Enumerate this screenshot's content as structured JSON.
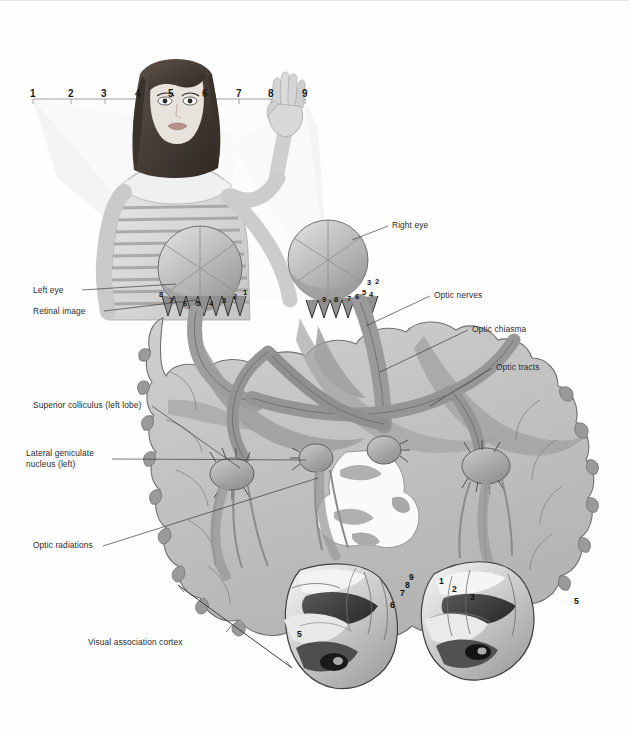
{
  "figure": {
    "background": "#ffffff",
    "palette": {
      "cortex_light": "#c9c9c9",
      "cortex_mid": "#a6a6a6",
      "cortex_dark": "#8c8c8c",
      "tract_gray": "#9a9a9a",
      "outline": "#4a4a4a",
      "cone_fill": "#f0f0f0",
      "label_color": "#2b2b2b"
    }
  },
  "scale_bar": {
    "name": "visual-field-scale",
    "ticks": [
      "1",
      "2",
      "3",
      "4",
      "5",
      "6",
      "7",
      "8",
      "9"
    ],
    "x_positions": [
      33,
      71,
      105,
      138,
      172,
      206,
      239,
      271,
      305
    ],
    "y": 92
  },
  "labels": {
    "left_eye": "Left eye",
    "retinal_image": "Retinal image",
    "right_eye": "Right eye",
    "optic_nerves": "Optic nerves",
    "optic_chiasma": "Optic chiasma",
    "optic_tracts": "Optic tracts",
    "superior_colliculus": "Superior colliculus (left lobe)",
    "lateral_geniculate": "Lateral geniculate nucleus (left)",
    "optic_radiations": "Optic radiations",
    "visual_association_cortex": "Visual association cortex"
  },
  "retina_numbers": {
    "left_eye": [
      "8",
      "7",
      "6",
      "5",
      "4",
      "3",
      "2",
      "1"
    ],
    "right_eye": [
      "9",
      "8",
      "7",
      "6",
      "5",
      "4",
      "3",
      "2"
    ]
  },
  "cortex_numbers": {
    "left_lobe": [
      "9",
      "8",
      "7",
      "6",
      "5"
    ],
    "right_lobe": [
      "1",
      "2",
      "3",
      "5"
    ]
  }
}
